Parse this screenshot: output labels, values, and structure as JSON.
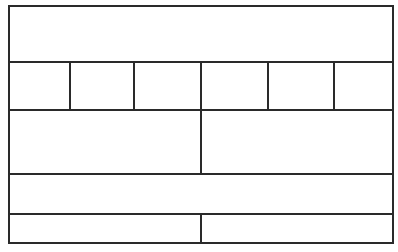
{
  "diagram": {
    "type": "grid-wireframe",
    "stroke_color": "#2a2a2a",
    "background_color": "#ffffff",
    "rows": [
      {
        "id": "row-1",
        "cells": [
          {
            "label": ""
          }
        ]
      },
      {
        "id": "row-2",
        "cells": [
          {
            "label": ""
          },
          {
            "label": ""
          },
          {
            "label": ""
          },
          {
            "label": ""
          },
          {
            "label": ""
          },
          {
            "label": ""
          }
        ]
      },
      {
        "id": "row-3",
        "cells": [
          {
            "label": ""
          },
          {
            "label": ""
          }
        ]
      },
      {
        "id": "row-4",
        "cells": [
          {
            "label": ""
          }
        ]
      },
      {
        "id": "row-5",
        "cells": [
          {
            "label": ""
          },
          {
            "label": ""
          }
        ]
      }
    ]
  }
}
